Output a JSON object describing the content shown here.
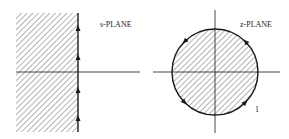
{
  "diagram": {
    "left_panel": {
      "label": "s-PLANE",
      "shaded_region": "left half-plane",
      "contour": "imaginary axis traversed upward"
    },
    "right_panel": {
      "label": "z-PLANE",
      "shaded_region": "interior of unit circle",
      "contour": "unit circle traversed counter-clockwise",
      "radius_label": "1"
    },
    "colors": {
      "line": "#1a1a1a",
      "hatch": "#555555",
      "background": "#ffffff"
    }
  }
}
